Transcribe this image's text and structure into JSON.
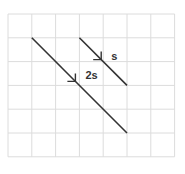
{
  "diagram": {
    "grid": {
      "columns": 7,
      "rows": 6
    },
    "lines": [
      {
        "name": "short-line",
        "label": "s",
        "from": [
          3,
          1
        ],
        "to": [
          5,
          3
        ]
      },
      {
        "name": "long-line",
        "label": "2s",
        "from": [
          1,
          1
        ],
        "to": [
          5,
          5
        ]
      }
    ],
    "colors": {
      "grid": "#dcdcdc",
      "line": "#333333",
      "background": "#ffffff"
    }
  }
}
